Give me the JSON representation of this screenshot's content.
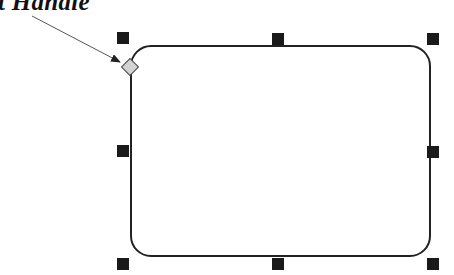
{
  "callout": {
    "label": "t Handle",
    "arrow_from": [
      32,
      16
    ],
    "arrow_to": [
      120,
      62
    ]
  },
  "shape": {
    "type": "rounded-rectangle",
    "x": 131,
    "y": 46,
    "width": 299,
    "height": 210,
    "corner_radius": 20,
    "stroke": "#222222",
    "fill": "#ffffff"
  },
  "adjust_handle": {
    "x": 130,
    "y": 67,
    "size": 13,
    "fill": "#d0d0d0",
    "stroke": "#444444"
  },
  "handles": [
    {
      "name": "top-left",
      "x": 117,
      "y": 32
    },
    {
      "name": "top-center",
      "x": 272,
      "y": 33
    },
    {
      "name": "top-right",
      "x": 427,
      "y": 33
    },
    {
      "name": "middle-left",
      "x": 117,
      "y": 145
    },
    {
      "name": "middle-right",
      "x": 427,
      "y": 146
    },
    {
      "name": "bottom-left",
      "x": 117,
      "y": 258
    },
    {
      "name": "bottom-center",
      "x": 272,
      "y": 258
    },
    {
      "name": "bottom-right",
      "x": 427,
      "y": 258
    }
  ],
  "colors": {
    "handle": "#1a1a1a",
    "arrow": "#333333"
  }
}
